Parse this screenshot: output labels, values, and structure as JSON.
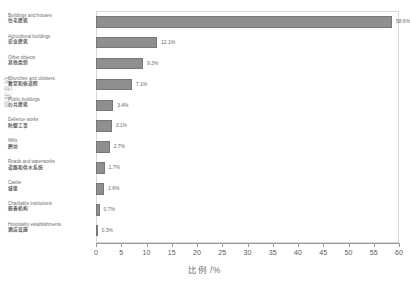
{
  "chart_data": {
    "type": "bar",
    "orientation": "horizontal",
    "title": "",
    "xlabel": "比例 /%",
    "ylabel": "原状名称",
    "xlim": [
      0,
      60
    ],
    "xticks": [
      0,
      5,
      10,
      15,
      20,
      25,
      30,
      35,
      40,
      45,
      50,
      55,
      60
    ],
    "grid": false,
    "legend": null,
    "bar_color": "#8f8f8f",
    "categories": [
      "Buildings and houses",
      "Agricultural buildings",
      "Other objects",
      "Churches and cloisters",
      "Public buildings",
      "Defence works",
      "Mills",
      "Roads and waterworks",
      "Castle",
      "Charitable institutions",
      "Hospitality establishments"
    ],
    "categories_zh": [
      "住宅建筑",
      "农业建筑",
      "其他类别",
      "教堂和修道院",
      "公共建筑",
      "防御工事",
      "磨坊",
      "道路和供水系统",
      "城堡",
      "慈善机构",
      "酒店设施"
    ],
    "values": [
      58.6,
      12.1,
      9.3,
      7.1,
      3.4,
      3.1,
      2.7,
      1.7,
      1.6,
      0.7,
      0.3
    ],
    "value_labels": [
      "58.6%",
      "12.1%",
      "9.3%",
      "7.1%",
      "3.4%",
      "3.1%",
      "2.7%",
      "1.7%",
      "1.6%",
      "0.7%",
      "0.3%"
    ]
  },
  "caption": ""
}
